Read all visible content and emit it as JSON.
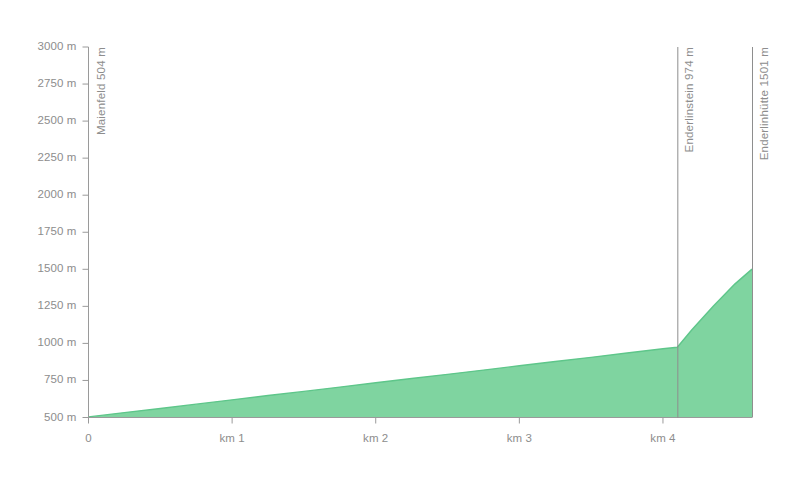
{
  "chart_data": {
    "type": "area",
    "title": "",
    "subtitle": "",
    "xlabel": "",
    "ylabel": "",
    "xlim": [
      0,
      4.62
    ],
    "ylim": [
      500,
      3000
    ],
    "grid": false,
    "legend_position": "none",
    "y_ticks": [
      {
        "value": 3000,
        "label": "3000 m"
      },
      {
        "value": 2750,
        "label": "2750 m"
      },
      {
        "value": 2500,
        "label": "2500 m"
      },
      {
        "value": 2250,
        "label": "2250 m"
      },
      {
        "value": 2000,
        "label": "2000 m"
      },
      {
        "value": 1750,
        "label": "1750 m"
      },
      {
        "value": 1500,
        "label": "1500 m"
      },
      {
        "value": 1250,
        "label": "1250 m"
      },
      {
        "value": 1000,
        "label": "1000 m"
      },
      {
        "value": 750,
        "label": "750 m"
      },
      {
        "value": 500,
        "label": "500 m"
      }
    ],
    "x_ticks": [
      {
        "value": 0,
        "label": "0"
      },
      {
        "value": 1,
        "label": "km 1"
      },
      {
        "value": 2,
        "label": "km 2"
      },
      {
        "value": 3,
        "label": "km 3"
      },
      {
        "value": 4,
        "label": "km 4"
      }
    ],
    "series": [
      {
        "name": "elevation",
        "x": [
          0.0,
          0.25,
          0.5,
          0.75,
          1.0,
          1.25,
          1.5,
          1.75,
          2.0,
          2.25,
          2.5,
          2.75,
          3.0,
          3.25,
          3.5,
          3.75,
          4.0,
          4.1,
          4.2,
          4.35,
          4.5,
          4.62
        ],
        "values": [
          504,
          533,
          561,
          590,
          619,
          648,
          676,
          705,
          734,
          763,
          791,
          820,
          849,
          878,
          906,
          935,
          964,
          974,
          1090,
          1250,
          1400,
          1501
        ]
      }
    ],
    "annotations": [
      {
        "name": "Maienfeld",
        "elevation_label": "504 m",
        "label": "Maienfeld  504 m",
        "x_km": 0.0,
        "elevation": 504
      },
      {
        "name": "Enderlinstein",
        "elevation_label": "974 m",
        "label": "Enderlinstein  974 m",
        "x_km": 4.1,
        "elevation": 974
      },
      {
        "name": "Enderlinhütte",
        "elevation_label": "1501 m",
        "label": "Enderlinhütte  1501 m",
        "x_km": 4.62,
        "elevation": 1501
      }
    ],
    "colors": {
      "fill": "#7fd4a0",
      "stroke": "#5ec68a",
      "axis": "#9a9a9a",
      "marker_line": "#8e8e8e",
      "text": "#8d8d8d",
      "background": "#ffffff"
    }
  }
}
